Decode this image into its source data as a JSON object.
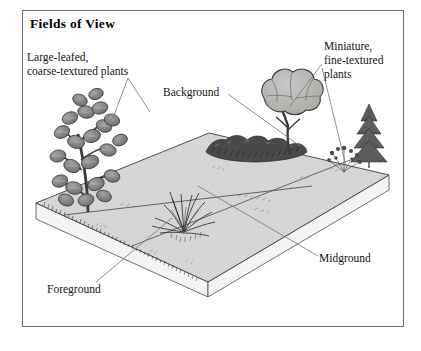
{
  "figure": {
    "title": "Fields of View",
    "kind": "landscape-perspective-diagram",
    "frame": {
      "stroke": "#6d6d6d"
    }
  },
  "labels": {
    "coarse": {
      "line1": "Large-leafed,",
      "line2": "coarse-textured plants"
    },
    "background": {
      "line1": "Background"
    },
    "fine": {
      "line1": "Miniature,",
      "line2": "fine-textured",
      "line3": "plants"
    },
    "foreground": {
      "line1": "Foreground"
    },
    "midground": {
      "line1": "Midground"
    }
  },
  "colors": {
    "ink": "#121212",
    "frame": "#6d6d6d",
    "ground_fill": "#d6d6d4",
    "ground_edge": "#3c3c3c",
    "slab_fill": "#f4f4f2",
    "canopy_fill": "#b4b4b2",
    "leaf_fill": "#8f8f8d",
    "hedge_fill": "#4a4a48",
    "leader": "#7a7a78",
    "paper": "#ffffff"
  },
  "scene": {
    "zones": [
      "Foreground",
      "Midground",
      "Background"
    ],
    "plants": [
      {
        "name": "large-leafed-shrub",
        "zone": "Foreground",
        "texture": "coarse"
      },
      {
        "name": "grass-clump",
        "zone": "Foreground",
        "texture": "medium"
      },
      {
        "name": "hedge-row",
        "zone": "Background",
        "texture": "medium"
      },
      {
        "name": "canopy-tree",
        "zone": "Background",
        "texture": "coarse"
      },
      {
        "name": "conifer",
        "zone": "Midground",
        "texture": "fine"
      }
    ]
  }
}
